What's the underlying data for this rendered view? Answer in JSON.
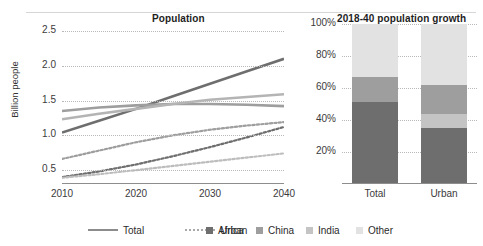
{
  "left": {
    "title": "Population",
    "ylabel": "Billion people",
    "yticks": [
      "2.5",
      "2.0",
      "1.5",
      "1.0",
      "0.5"
    ],
    "xticks": [
      "2010",
      "2020",
      "2030",
      "2040"
    ]
  },
  "right": {
    "title": "2018-40 population growth",
    "yticks": [
      "100%",
      "80%",
      "60%",
      "40%",
      "20%"
    ],
    "xticks": [
      "Total",
      "Urban"
    ]
  },
  "legend": [
    {
      "label": "Total",
      "marker": "solid-line",
      "color": "#8c8c8c"
    },
    {
      "label": "Urban",
      "marker": "dotted-line",
      "color": "#a8a8a8"
    },
    {
      "label": "Africa",
      "marker": "square",
      "color": "#6e6e6e"
    },
    {
      "label": "China",
      "marker": "square",
      "color": "#9e9e9e"
    },
    {
      "label": "India",
      "marker": "square",
      "color": "#c4c4c4"
    },
    {
      "label": "Other",
      "marker": "square",
      "color": "#e2e2e2"
    }
  ],
  "chart_data": [
    {
      "type": "line",
      "title": "Population",
      "xlabel": "",
      "ylabel": "Billion people",
      "xlim": [
        2010,
        2040
      ],
      "ylim": [
        0.3,
        2.6
      ],
      "yticks": [
        0.5,
        1.0,
        1.5,
        2.0,
        2.5
      ],
      "xticks": [
        2010,
        2020,
        2030,
        2040
      ],
      "grid": "horizontal-dotted",
      "x": [
        2010,
        2015,
        2020,
        2025,
        2030,
        2035,
        2040
      ],
      "series": [
        {
          "name": "Africa Total",
          "style": "solid",
          "color": "#6e6e6e",
          "values": [
            1.04,
            1.21,
            1.38,
            1.56,
            1.74,
            1.92,
            2.1
          ]
        },
        {
          "name": "China Total",
          "style": "solid",
          "color": "#9e9e9e",
          "values": [
            1.35,
            1.4,
            1.43,
            1.45,
            1.45,
            1.44,
            1.42
          ]
        },
        {
          "name": "India Total",
          "style": "solid",
          "color": "#b4b4b4",
          "values": [
            1.23,
            1.31,
            1.38,
            1.45,
            1.51,
            1.55,
            1.59
          ]
        },
        {
          "name": "China Urban",
          "style": "dotted",
          "color": "#9e9e9e",
          "values": [
            0.66,
            0.78,
            0.9,
            1.0,
            1.08,
            1.14,
            1.19
          ]
        },
        {
          "name": "Africa Urban",
          "style": "dotted",
          "color": "#6e6e6e",
          "values": [
            0.4,
            0.48,
            0.58,
            0.7,
            0.83,
            0.97,
            1.12
          ]
        },
        {
          "name": "India Urban",
          "style": "dotted",
          "color": "#bdbdbd",
          "values": [
            0.39,
            0.44,
            0.5,
            0.56,
            0.62,
            0.68,
            0.74
          ]
        }
      ]
    },
    {
      "type": "bar",
      "subtype": "stacked-100",
      "title": "2018-40 population growth",
      "xlabel": "",
      "ylabel": "",
      "ylim": [
        0,
        100
      ],
      "yticks": [
        20,
        40,
        60,
        80,
        100
      ],
      "grid": "horizontal-dotted",
      "categories": [
        "Total",
        "Urban"
      ],
      "series": [
        {
          "name": "Africa",
          "color": "#6e6e6e",
          "values": [
            51,
            35
          ]
        },
        {
          "name": "India",
          "color": "#c4c4c4",
          "values": [
            0,
            9
          ]
        },
        {
          "name": "China",
          "color": "#9e9e9e",
          "values": [
            16,
            18
          ]
        },
        {
          "name": "Other",
          "color": "#e2e2e2",
          "values": [
            33,
            38
          ]
        }
      ]
    }
  ]
}
